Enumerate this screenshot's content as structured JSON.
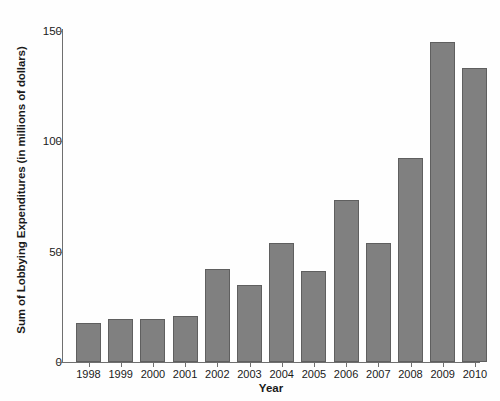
{
  "chart_data": {
    "type": "bar",
    "title": "",
    "xlabel": "Year",
    "ylabel": "Sum of Lobbying Expenditures (in millions of dollars)",
    "categories": [
      "1998",
      "1999",
      "2000",
      "2001",
      "2002",
      "2003",
      "2004",
      "2005",
      "2006",
      "2007",
      "2008",
      "2009",
      "2010"
    ],
    "values": [
      17.5,
      19.5,
      19.5,
      21,
      42,
      35,
      54,
      41,
      73.5,
      54,
      92.5,
      145,
      133
    ],
    "series": [
      {
        "name": "Sum of Lobbying Expenditures",
        "values": [
          17.5,
          19.5,
          19.5,
          21,
          42,
          35,
          54,
          41,
          73.5,
          54,
          92.5,
          145,
          133
        ]
      }
    ],
    "ylim": [
      0,
      157
    ],
    "xlim_note": "categorical",
    "ytick_labels": [
      "0",
      "50",
      "100",
      "150"
    ],
    "ytick_values": [
      0,
      50,
      100,
      150
    ],
    "grid": false,
    "legend": "none",
    "bar_color": "#808080",
    "bar_edge_color": "#5f5f5f",
    "axis_color": "#6f6f6f",
    "background_color": "#fefefe"
  }
}
